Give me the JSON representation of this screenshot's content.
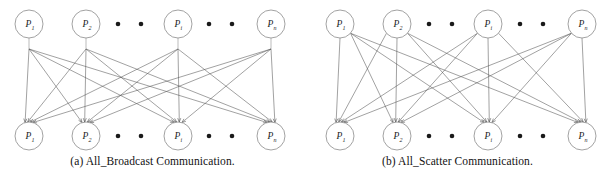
{
  "figure": {
    "width": 610,
    "height": 180,
    "background": "#ffffff",
    "line_color": "#555555",
    "node_stroke": "#8a8a8a",
    "text_color": "#1a1a1a"
  },
  "panels": [
    {
      "id": "all-broadcast",
      "caption": "(a) All_Broadcast Communication.",
      "caption_label": "(a)",
      "caption_title": "All_Broadcast Communication.",
      "edge_style": "stem",
      "top_row": {
        "label_prefix": "P",
        "nodes": [
          {
            "label": "P",
            "sub": "1",
            "cx": 29,
            "cy": 24
          },
          {
            "label": "P",
            "sub": "2",
            "cx": 86,
            "cy": 24
          },
          {
            "label": "P",
            "sub": "i",
            "cx": 178,
            "cy": 24
          },
          {
            "label": "P",
            "sub": "n",
            "cx": 271,
            "cy": 24
          }
        ],
        "ellipsis_dots": [
          {
            "cx": 118,
            "cy": 24
          },
          {
            "cx": 141,
            "cy": 24
          },
          {
            "cx": 209,
            "cy": 24
          },
          {
            "cx": 232,
            "cy": 24
          }
        ]
      },
      "bottom_row": {
        "label_prefix": "P",
        "nodes": [
          {
            "label": "P",
            "sub": "1",
            "cx": 29,
            "cy": 136
          },
          {
            "label": "P",
            "sub": "2",
            "cx": 86,
            "cy": 136
          },
          {
            "label": "P",
            "sub": "i",
            "cx": 178,
            "cy": 136
          },
          {
            "label": "P",
            "sub": "n",
            "cx": 271,
            "cy": 136
          }
        ],
        "ellipsis_dots": [
          {
            "cx": 118,
            "cy": 136
          },
          {
            "cx": 141,
            "cy": 136
          },
          {
            "cx": 209,
            "cy": 136
          },
          {
            "cx": 232,
            "cy": 136
          }
        ]
      },
      "node_radius": 14,
      "stem_length": 11,
      "edges": [
        {
          "from": 0,
          "to": 0
        },
        {
          "from": 0,
          "to": 1
        },
        {
          "from": 0,
          "to": 2
        },
        {
          "from": 0,
          "to": 3
        },
        {
          "from": 1,
          "to": 0
        },
        {
          "from": 1,
          "to": 1
        },
        {
          "from": 1,
          "to": 2
        },
        {
          "from": 1,
          "to": 3
        },
        {
          "from": 2,
          "to": 0
        },
        {
          "from": 2,
          "to": 1
        },
        {
          "from": 2,
          "to": 2
        },
        {
          "from": 2,
          "to": 3
        },
        {
          "from": 3,
          "to": 0
        },
        {
          "from": 3,
          "to": 1
        },
        {
          "from": 3,
          "to": 2
        },
        {
          "from": 3,
          "to": 3
        }
      ]
    },
    {
      "id": "all-scatter",
      "caption": "(b) All_Scatter Communication.",
      "caption_label": "(b)",
      "caption_title": "All_Scatter Communication.",
      "edge_style": "direct",
      "top_row": {
        "label_prefix": "P",
        "nodes": [
          {
            "label": "P",
            "sub": "1",
            "cx": 35,
            "cy": 24
          },
          {
            "label": "P",
            "sub": "2",
            "cx": 92,
            "cy": 24
          },
          {
            "label": "P",
            "sub": "i",
            "cx": 183,
            "cy": 24
          },
          {
            "label": "P",
            "sub": "n",
            "cx": 277,
            "cy": 24
          }
        ],
        "ellipsis_dots": [
          {
            "cx": 124,
            "cy": 24
          },
          {
            "cx": 147,
            "cy": 24
          },
          {
            "cx": 215,
            "cy": 24
          },
          {
            "cx": 238,
            "cy": 24
          }
        ]
      },
      "bottom_row": {
        "label_prefix": "P",
        "nodes": [
          {
            "label": "P",
            "sub": "1",
            "cx": 35,
            "cy": 136
          },
          {
            "label": "P",
            "sub": "2",
            "cx": 92,
            "cy": 136
          },
          {
            "label": "P",
            "sub": "i",
            "cx": 183,
            "cy": 136
          },
          {
            "label": "P",
            "sub": "n",
            "cx": 277,
            "cy": 136
          }
        ],
        "ellipsis_dots": [
          {
            "cx": 124,
            "cy": 136
          },
          {
            "cx": 147,
            "cy": 136
          },
          {
            "cx": 215,
            "cy": 136
          },
          {
            "cx": 238,
            "cy": 136
          }
        ]
      },
      "node_radius": 14,
      "stem_length": 0,
      "edges": [
        {
          "from": 0,
          "to": 0
        },
        {
          "from": 0,
          "to": 1
        },
        {
          "from": 0,
          "to": 2
        },
        {
          "from": 0,
          "to": 3
        },
        {
          "from": 1,
          "to": 0
        },
        {
          "from": 1,
          "to": 1
        },
        {
          "from": 1,
          "to": 2
        },
        {
          "from": 1,
          "to": 3
        },
        {
          "from": 2,
          "to": 0
        },
        {
          "from": 2,
          "to": 1
        },
        {
          "from": 2,
          "to": 2
        },
        {
          "from": 2,
          "to": 3
        },
        {
          "from": 3,
          "to": 0
        },
        {
          "from": 3,
          "to": 1
        },
        {
          "from": 3,
          "to": 2
        },
        {
          "from": 3,
          "to": 3
        }
      ]
    }
  ]
}
